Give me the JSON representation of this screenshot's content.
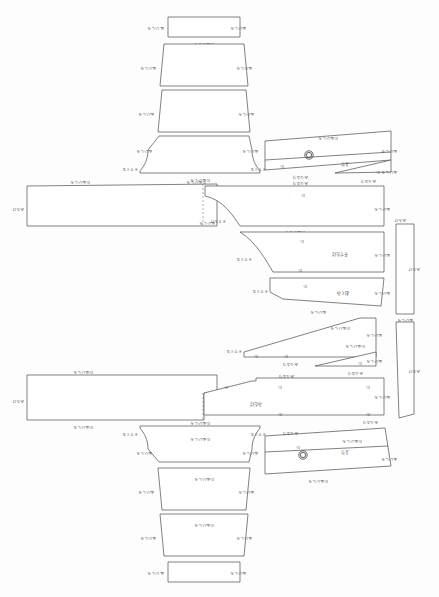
{
  "document": {
    "title": "縫製パターン配置図",
    "type": "garment-pattern-marker-layout",
    "background_color": "#fdfdfd",
    "line_color": "#4a4a4a",
    "fold_line_color": "#8a8a8a",
    "canvas": {
      "width": 439,
      "height": 597
    }
  },
  "labels": {
    "wanuinoshiro": "わぬいしろ",
    "wanui": "わぬい",
    "mimi": "みみ",
    "mitsuorі": "みつおり",
    "sodeguchi": "そでぐち",
    "eri": "えり",
    "sodetake": "そでたけ",
    "mitake": "みたけ",
    "okumi": "おくみ",
    "maeHaba": "まえはば",
    "ushiroHaba": "うしろはば",
    "suso": "すそ",
    "katayama": "かたやま",
    "wa": "わ",
    "nui": "ぬい",
    "shiro": "しろ"
  },
  "pieces": [
    {
      "id": "p1",
      "name": "top-band-rect",
      "shape": "rectangle",
      "bbox": [
        168,
        17,
        72,
        20
      ],
      "edge_labels": {
        "left": "ぬいしろ",
        "right": "ぬいしろ",
        "bottom": "わぬいしろ"
      }
    },
    {
      "id": "p2",
      "name": "top-trapezoid-upper",
      "shape": "trapezoid",
      "bbox": [
        160,
        44,
        88,
        42
      ],
      "edge_labels": {
        "left": "ぬいしろ",
        "right": "ぬいしろ",
        "bottom": "わぬいしろ"
      }
    },
    {
      "id": "p3",
      "name": "top-trapezoid-lower",
      "shape": "trapezoid",
      "bbox": [
        158,
        90,
        92,
        42
      ],
      "edge_labels": {
        "left": "ぬいしろ",
        "right": "ぬいしろ",
        "bottom": "わぬいしろ"
      }
    },
    {
      "id": "p4",
      "name": "top-yoke-curved",
      "shape": "curved-yoke",
      "bbox": [
        140,
        135,
        120,
        38
      ],
      "edge_labels": {
        "left": "ぬいしろ",
        "right": "ぬいしろ",
        "bottom": "わぬいしろ",
        "lower_left": "そでぐち",
        "lower_right": "そでぐち"
      }
    },
    {
      "id": "p5",
      "name": "top-collar-band",
      "shape": "slanted-band",
      "bbox": [
        265,
        130,
        128,
        40
      ],
      "center_label": "えり",
      "edge_labels": {
        "top": "わぬいしろ",
        "right": "ぬいしろ",
        "bottom": "みつおり",
        "inner": "わ"
      },
      "marker": {
        "type": "concentric-circle",
        "cx": 309,
        "cy": 155,
        "r_outer": 4.2,
        "r_inner": 2.6
      }
    },
    {
      "id": "p6",
      "name": "top-sliver-wedge",
      "shape": "thin-triangle",
      "bbox": [
        335,
        160,
        58,
        14
      ],
      "edge_labels": {
        "bottom": "みつおり",
        "right": "ぬいしろ",
        "inner": "わ"
      }
    },
    {
      "id": "p7",
      "name": "left-main-panel-upper",
      "shape": "rectangle-fold",
      "bbox": [
        27,
        182,
        190,
        45
      ],
      "edge_labels": {
        "top_left": "わぬいしろ",
        "top_right": "わぬいしろ",
        "left": "みたけ",
        "right": "ぬいしろ"
      },
      "fold_line": true
    },
    {
      "id": "p8",
      "name": "right-body-panel-upper",
      "shape": "curved-panel",
      "bbox": [
        218,
        182,
        166,
        50
      ],
      "center_label": "わ",
      "edge_labels": {
        "top": "みつおり",
        "right": "ぬいしろ",
        "bottom": "わぬいしろ",
        "left": "そでたけ"
      }
    },
    {
      "id": "p9",
      "name": "sleeve-panel",
      "shape": "curved-panel",
      "bbox": [
        232,
        232,
        152,
        44
      ],
      "center_label": "そでたけ",
      "edge_labels": {
        "top": "わ",
        "right": "ぬいしろ",
        "bottom": "わ",
        "left": "そでぐち"
      }
    },
    {
      "id": "p10",
      "name": "okumi-panel-upper",
      "shape": "slanted-panel",
      "bbox": [
        238,
        278,
        146,
        32
      ],
      "center_label": "おくみ",
      "edge_labels": {
        "top": "わ",
        "right": "ぬいしろ",
        "bottom": "ぬいしろ",
        "left": "そでぐち"
      }
    },
    {
      "id": "p11",
      "name": "right-strip-upper",
      "shape": "narrow-strip",
      "bbox": [
        396,
        224,
        18,
        90
      ],
      "edge_labels": {
        "top": "みたけ",
        "right": "みたけ",
        "bottom": "ぬいしろ"
      }
    },
    {
      "id": "p12",
      "name": "right-strip-lower",
      "shape": "narrow-strip",
      "bbox": [
        396,
        320,
        18,
        98
      ],
      "edge_labels": {
        "right": "みたけ",
        "bottom": "ぬいしろ"
      }
    },
    {
      "id": "p13",
      "name": "angled-wedge-panel",
      "shape": "angled-wedge",
      "bbox": [
        240,
        318,
        136,
        48
      ],
      "edge_labels": {
        "top_right": "わぬいしろ",
        "right": "ぬいしろ",
        "bottom": "みつおり",
        "left": "そでぐち",
        "inner": "わ"
      }
    },
    {
      "id": "p14",
      "name": "thin-sliver-mid",
      "shape": "thin-triangle",
      "bbox": [
        315,
        352,
        78,
        14
      ],
      "edge_labels": {
        "bottom": "みつおり",
        "right": "ぬいしろ",
        "inner": "わ"
      }
    },
    {
      "id": "p15",
      "name": "left-main-panel-lower",
      "shape": "rectangle-fold",
      "bbox": [
        27,
        373,
        190,
        48
      ],
      "edge_labels": {
        "top": "わぬいしろ",
        "left": "みたけ",
        "bottom_left": "わぬいしろ",
        "bottom_right": "わぬいしろ"
      },
      "fold_line": true
    },
    {
      "id": "p16",
      "name": "right-body-panel-lower",
      "shape": "notched-panel",
      "bbox": [
        218,
        378,
        166,
        44
      ],
      "center_label": "みたけ",
      "edge_labels": {
        "top": "みつおり",
        "right": "ぬいしろ",
        "bottom": "みつおり",
        "inner": "わ"
      }
    },
    {
      "id": "p17",
      "name": "bottom-yoke-curved",
      "shape": "curved-yoke",
      "bbox": [
        140,
        424,
        120,
        38
      ],
      "center_label": "わぬいしろ",
      "edge_labels": {
        "top": "わぬいしろ",
        "left": "ぬいしろ",
        "right": "ぬいしろ",
        "lower_left": "そでぐち",
        "lower_right": "そでぐち"
      }
    },
    {
      "id": "p18",
      "name": "bottom-collar-band",
      "shape": "slanted-band",
      "bbox": [
        265,
        428,
        128,
        46
      ],
      "center_label": "えり",
      "edge_labels": {
        "top": "わぬいしろ",
        "right": "ぬいしろ",
        "bottom": "わぬいしろ",
        "left": "みつおり",
        "inner": "わ"
      },
      "marker": {
        "type": "concentric-circle",
        "cx": 303,
        "cy": 455,
        "r_outer": 4.2,
        "r_inner": 2.6
      }
    },
    {
      "id": "p19",
      "name": "bottom-trapezoid-upper",
      "shape": "trapezoid",
      "bbox": [
        158,
        468,
        92,
        42
      ],
      "center_label": "わぬいしろ",
      "edge_labels": {
        "left": "ぬいしろ",
        "right": "ぬいしろ"
      }
    },
    {
      "id": "p20",
      "name": "bottom-trapezoid-lower",
      "shape": "trapezoid",
      "bbox": [
        160,
        514,
        88,
        42
      ],
      "center_label": "わぬいしろ",
      "edge_labels": {
        "left": "ぬいしろ",
        "right": "ぬいしろ"
      }
    },
    {
      "id": "p21",
      "name": "bottom-band-rect",
      "shape": "rectangle",
      "bbox": [
        168,
        562,
        72,
        20
      ],
      "edge_labels": {
        "left": "ぬいしろ",
        "right": "ぬいしろ"
      }
    }
  ]
}
